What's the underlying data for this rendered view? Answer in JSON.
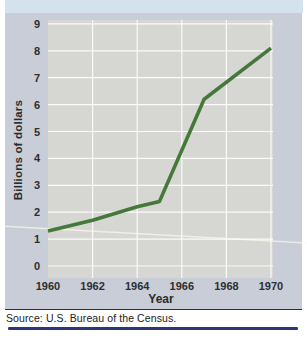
{
  "figure": {
    "y_axis_title": "Billions of dollars",
    "x_axis_title": "Year",
    "source": "Source: U.S. Bureau of the Census."
  },
  "chart_data": {
    "type": "line",
    "title": "",
    "xlabel": "Year",
    "ylabel": "Billions of dollars",
    "x": [
      1960,
      1962,
      1964,
      1965,
      1967,
      1970
    ],
    "y": [
      1.3,
      1.7,
      2.2,
      2.4,
      6.2,
      8.1
    ],
    "xticks": [
      1960,
      1962,
      1964,
      1966,
      1968,
      1970
    ],
    "yticks": [
      0,
      1,
      2,
      3,
      4,
      5,
      6,
      7,
      8,
      9
    ],
    "xlim": [
      1960,
      1970
    ],
    "ylim": [
      0,
      9
    ],
    "grid": true,
    "legend": "none",
    "line_color": "#45793a",
    "plot_bg_color": "#d6d7d2",
    "grid_color": "#ffffff",
    "panel_bg_color": "#c8cdd8",
    "accent_rule_color": "#2f3678"
  }
}
